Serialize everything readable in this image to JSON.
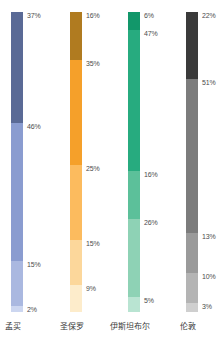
{
  "chart_data": {
    "type": "bar",
    "subtype": "stacked-100-percent",
    "title": "",
    "xlabel": "",
    "ylabel": "",
    "ylim": [
      0,
      100
    ],
    "grid": false,
    "legend": "none",
    "orientation": "vertical",
    "value_suffix": "%",
    "categories": [
      "孟买",
      "圣保罗",
      "伊斯坦布尔",
      "伦敦"
    ],
    "series": [
      {
        "name": "孟买",
        "label": "孟买",
        "x": 11,
        "label_x": -22,
        "segments": [
          {
            "value": 37,
            "label": "37%",
            "color": "#5a6a96"
          },
          {
            "value": 46,
            "label": "46%",
            "color": "#8a9cd0"
          },
          {
            "value": 15,
            "label": "15%",
            "color": "#aab8e0"
          },
          {
            "value": 2,
            "label": "2%",
            "color": "#ccd6f0"
          }
        ]
      },
      {
        "name": "圣保罗",
        "label": "圣保罗",
        "x": 70,
        "label_x": 37,
        "segments": [
          {
            "value": 16,
            "label": "16%",
            "color": "#b07b20"
          },
          {
            "value": 35,
            "label": "35%",
            "color": "#f5a02a"
          },
          {
            "value": 25,
            "label": "25%",
            "color": "#fcbb5e"
          },
          {
            "value": 15,
            "label": "15%",
            "color": "#fcd79b"
          },
          {
            "value": 9,
            "label": "9%",
            "color": "#fdeccb"
          }
        ]
      },
      {
        "name": "伊斯坦布尔",
        "label": "伊斯坦布尔",
        "x": 128,
        "label_x": 95,
        "segments": [
          {
            "value": 6,
            "label": "6%",
            "color": "#12976a"
          },
          {
            "value": 47,
            "label": "47%",
            "color": "#27ab7f"
          },
          {
            "value": 16,
            "label": "16%",
            "color": "#5cc09a"
          },
          {
            "value": 26,
            "label": "26%",
            "color": "#8ed2b5"
          },
          {
            "value": 5,
            "label": "5%",
            "color": "#b9e4d2"
          }
        ]
      },
      {
        "name": "伦敦",
        "label": "伦敦",
        "x": 186,
        "label_x": 153,
        "segments": [
          {
            "value": 22,
            "label": "22%",
            "color": "#3a3a3a"
          },
          {
            "value": 51,
            "label": "51%",
            "color": "#7c7c7c"
          },
          {
            "value": 13,
            "label": "13%",
            "color": "#9a9a9a"
          },
          {
            "value": 10,
            "label": "10%",
            "color": "#b4b4b4"
          },
          {
            "value": 3,
            "label": "3%",
            "color": "#cfcfcf"
          }
        ]
      }
    ]
  },
  "colors": {
    "background": "#ffffff",
    "label_text": "#4c4c4c",
    "category_text": "#3a3a3a"
  }
}
